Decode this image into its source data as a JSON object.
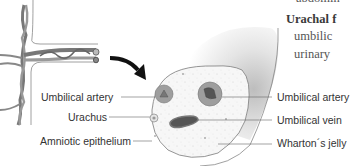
{
  "diagram": {
    "labels_left": [
      {
        "text": "Umbilical artery",
        "x": 41,
        "y": 91
      },
      {
        "text": "Urachus",
        "x": 68,
        "y": 111
      },
      {
        "text": "Amniotic epithelium",
        "x": 40,
        "y": 135
      }
    ],
    "labels_right": [
      {
        "text": "Umbilical artery",
        "x": 277,
        "y": 91
      },
      {
        "text": "Umbilical vein",
        "x": 277,
        "y": 113
      },
      {
        "text": "Wharton´s jelly",
        "x": 277,
        "y": 135
      }
    ],
    "side_text": {
      "line1": "abdomin",
      "line2_bold": "Urachal f",
      "line3": "umbilic",
      "line4": "urinary"
    },
    "colors": {
      "line": "#666666",
      "vessel_fill": "#9a9a9a",
      "vessel_lumen": "#555555",
      "jelly": "#f4f4f4",
      "text": "#333333"
    }
  }
}
